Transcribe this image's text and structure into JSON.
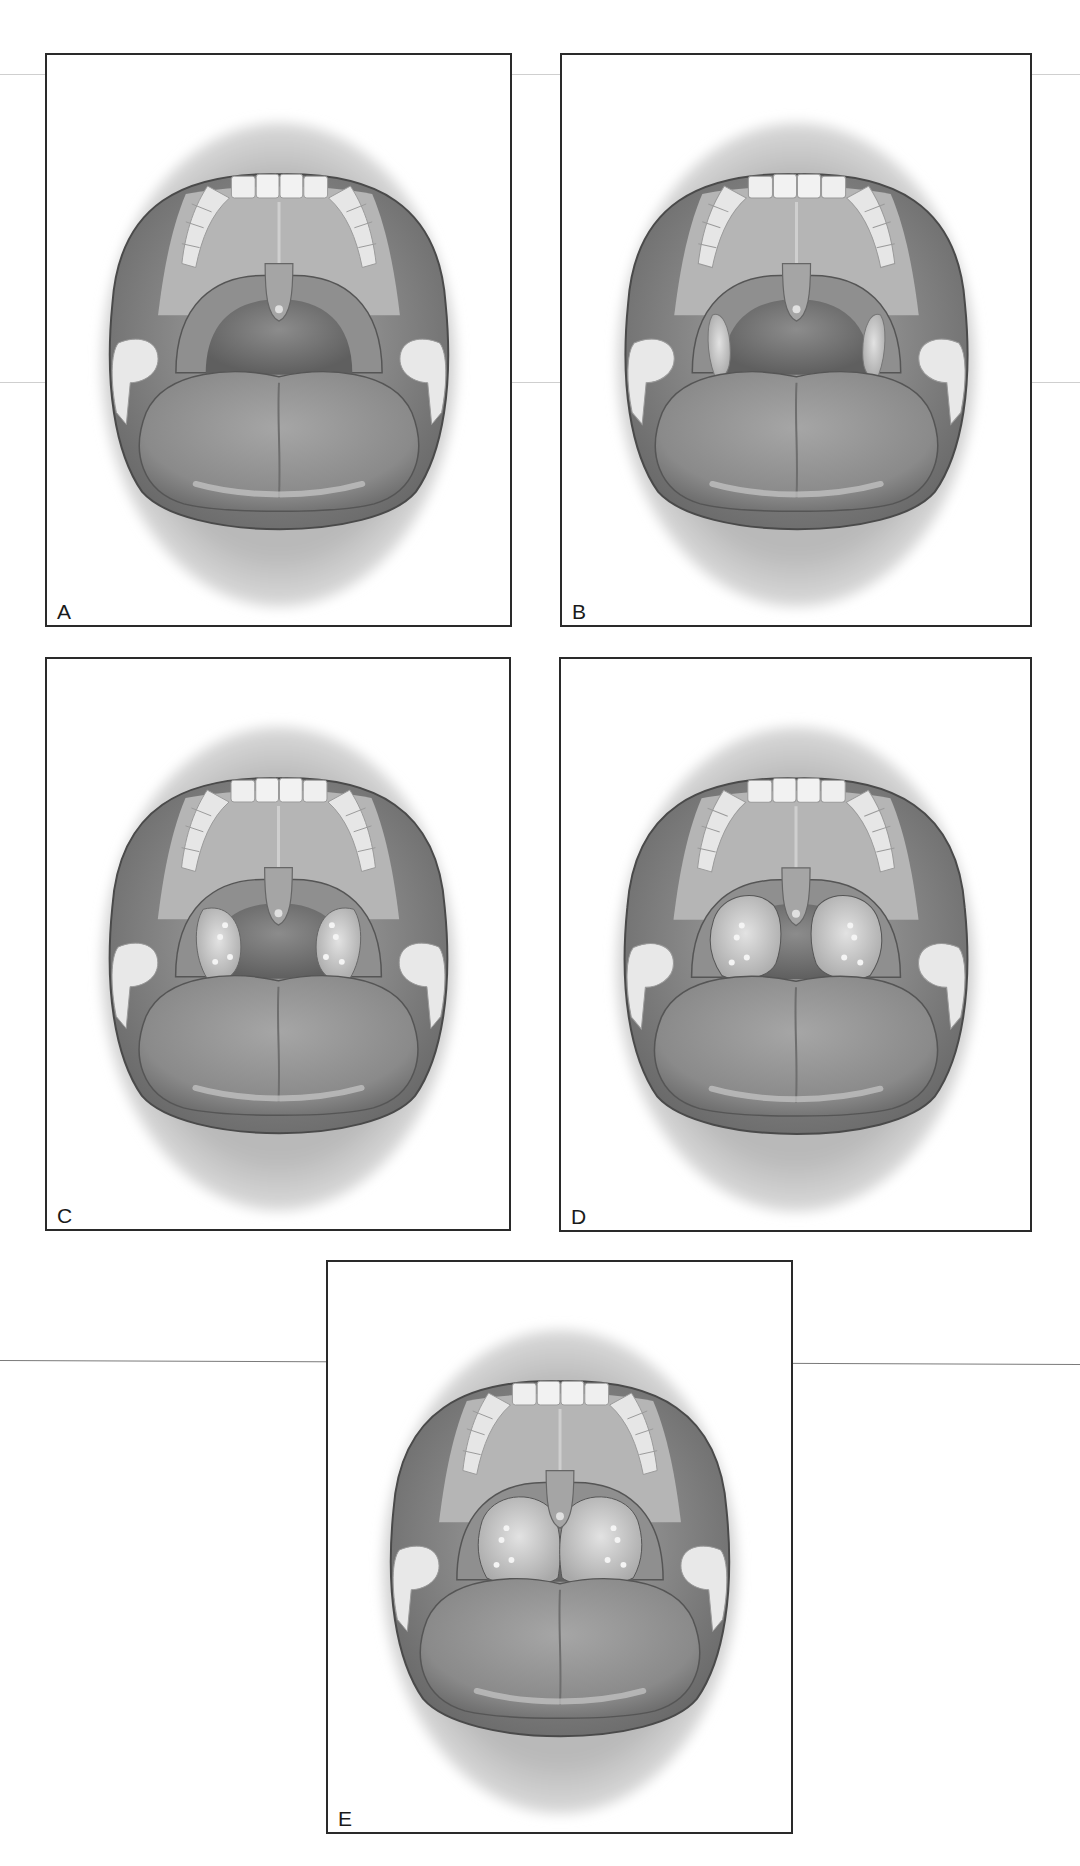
{
  "figure": {
    "colors": {
      "border": "#2a2a2a",
      "background": "#ffffff",
      "tissue_mid": "#9a9a9a",
      "tissue_dark": "#5e5e5e",
      "teeth": "#ececec",
      "lips": "#c4c4c4"
    },
    "panels": [
      {
        "id": "A",
        "label": "A",
        "tonsil_size": 0,
        "x": 45,
        "y": 53,
        "w": 467,
        "h": 574
      },
      {
        "id": "B",
        "label": "B",
        "tonsil_size": 1,
        "x": 560,
        "y": 53,
        "w": 472,
        "h": 574
      },
      {
        "id": "C",
        "label": "C",
        "tonsil_size": 2,
        "x": 45,
        "y": 657,
        "w": 466,
        "h": 574
      },
      {
        "id": "D",
        "label": "D",
        "tonsil_size": 3,
        "x": 559,
        "y": 657,
        "w": 473,
        "h": 575
      },
      {
        "id": "E",
        "label": "E",
        "tonsil_size": 4,
        "x": 326,
        "y": 1260,
        "w": 467,
        "h": 574
      }
    ]
  }
}
